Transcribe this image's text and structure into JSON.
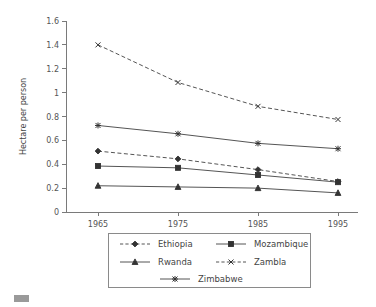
{
  "chart_data": {
    "type": "line",
    "title": "",
    "subtitle": "",
    "xlabel": "",
    "ylabel": "Hectare per person",
    "x": [
      1965,
      1975,
      1985,
      1995
    ],
    "categories": [
      "1965",
      "1975",
      "1985",
      "1995"
    ],
    "xtick_labels": [
      "1965",
      "1975",
      "1985",
      "1995"
    ],
    "ytick_labels": [
      "0",
      "0.2",
      "0.4",
      "0.6",
      "0.8",
      "1",
      "1.2",
      "1.4",
      "1.6"
    ],
    "ytick_values": [
      0,
      0.2,
      0.4,
      0.6,
      0.8,
      1,
      1.2,
      1.4,
      1.6
    ],
    "ylim": [
      0,
      1.6
    ],
    "xlim": [
      1960,
      2000
    ],
    "grid": false,
    "legend_position": "bottom",
    "series": [
      {
        "name": "Ethiopia",
        "marker": "diamond",
        "linestyle": "dashed",
        "color": "#555555",
        "values": [
          0.51,
          0.445,
          0.355,
          0.255
        ]
      },
      {
        "name": "Mozambique",
        "marker": "square",
        "linestyle": "solid",
        "color": "#555555",
        "values": [
          0.385,
          0.37,
          0.31,
          0.25
        ]
      },
      {
        "name": "Rwanda",
        "marker": "triangle",
        "linestyle": "solid",
        "color": "#555555",
        "values": [
          0.22,
          0.21,
          0.2,
          0.16
        ]
      },
      {
        "name": "Zambla",
        "marker": "x",
        "linestyle": "dashed",
        "color": "#555555",
        "values": [
          1.4,
          1.085,
          0.885,
          0.775
        ]
      },
      {
        "name": "Zimbabwe",
        "marker": "asterisk",
        "linestyle": "solid",
        "color": "#555555",
        "values": [
          0.725,
          0.655,
          0.575,
          0.53
        ]
      }
    ]
  },
  "legend": {
    "entries": [
      {
        "label": "Ethiopia"
      },
      {
        "label": "Mozambique"
      },
      {
        "label": "Rwanda"
      },
      {
        "label": "Zambla"
      },
      {
        "label": "Zimbabwe"
      }
    ]
  },
  "colors": {
    "axis": "#7a7a7a",
    "series": "#555555",
    "marker": "#333333",
    "text": "#444444",
    "background": "#ffffff"
  }
}
